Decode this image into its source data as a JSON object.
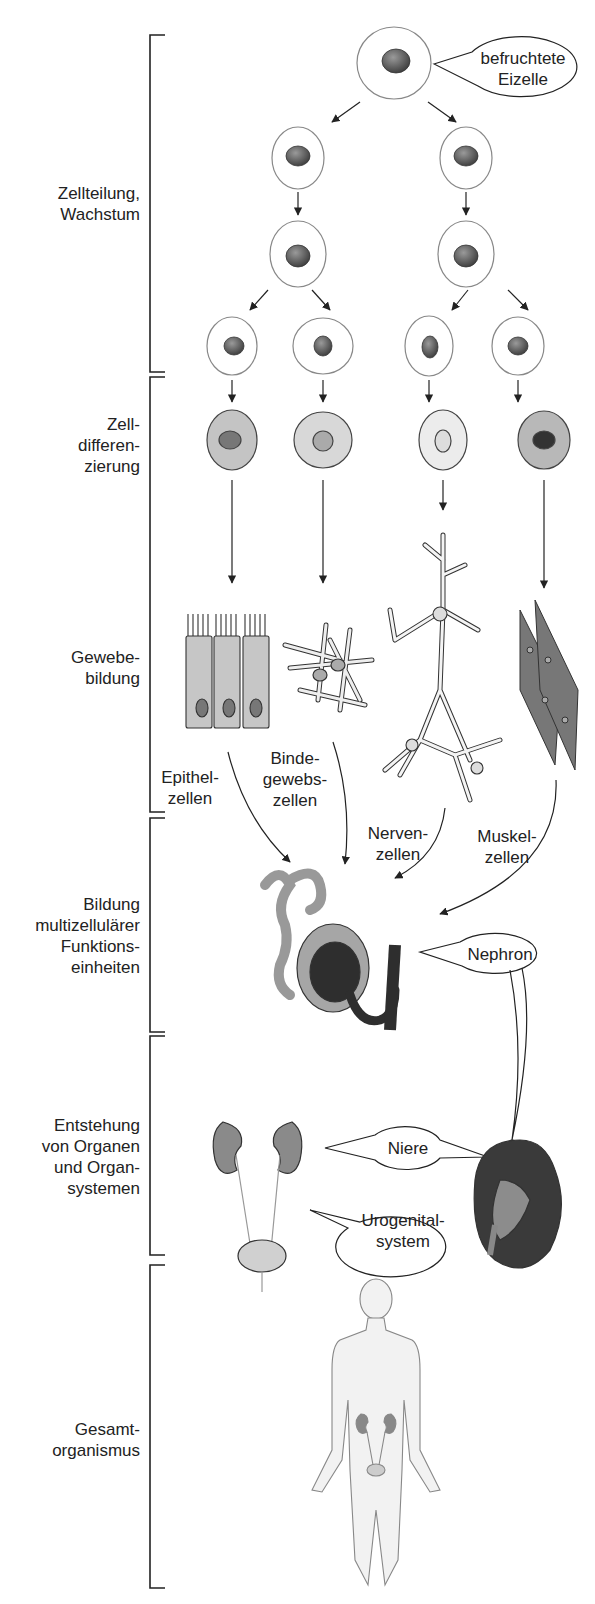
{
  "stages": [
    {
      "id": "zellteilung",
      "label": "Zellteilung,\nWachstum"
    },
    {
      "id": "zelldifferenzierung",
      "label": "Zell-\ndifferen-\nzierung"
    },
    {
      "id": "gewebebildung",
      "label": "Gewebe-\nbildung"
    },
    {
      "id": "funktionseinheiten",
      "label": "Bildung\nmultizellulärer\nFunktions-\neinheiten"
    },
    {
      "id": "organe",
      "label": "Entstehung\nvon Organen\nund Organ-\nsystemen"
    },
    {
      "id": "gesamtorganismus",
      "label": "Gesamt-\norganismus"
    }
  ],
  "callouts": {
    "eizelle": "befruchtete\nEizelle",
    "nephron": "Nephron",
    "niere": "Niere",
    "urogenital": "Urogenital-\nsystem"
  },
  "tissues": [
    {
      "id": "epithel",
      "label": "Epithel-\nzellen"
    },
    {
      "id": "binde",
      "label": "Binde-\ngewebs-\nzellen"
    },
    {
      "id": "nerven",
      "label": "Nerven-\nzellen"
    },
    {
      "id": "muskel",
      "label": "Muskel-\nzellen"
    }
  ],
  "colors": {
    "line": "#222222",
    "cell_fill": "#ffffff",
    "nucleus": "#555555",
    "diff_fill": "#c8c8c8",
    "organ_dark": "#3a3a3a",
    "organ_mid": "#8a8a8a",
    "organ_light": "#bdbdbd"
  }
}
